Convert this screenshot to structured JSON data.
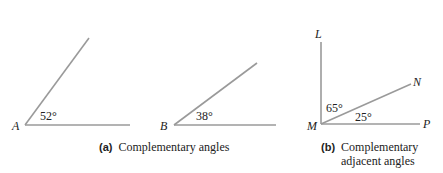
{
  "figure_a": {
    "angle_a": {
      "vertex": "A",
      "measure": "52°"
    },
    "angle_b": {
      "vertex": "B",
      "measure": "38°"
    },
    "caption_tag": "(a)",
    "caption": "Complementary angles"
  },
  "figure_b": {
    "vertex": "M",
    "points": {
      "top": "L",
      "middle": "N",
      "right": "P"
    },
    "angle_lmn": "65°",
    "angle_nmp": "25°",
    "caption_tag": "(b)",
    "caption_line1": "Complementary",
    "caption_line2": "adjacent angles"
  },
  "colors": {
    "line": "#9a9a9a",
    "text": "#222222"
  }
}
